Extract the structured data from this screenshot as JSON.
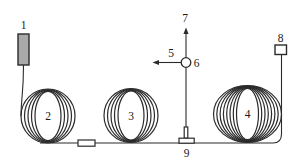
{
  "diagram": {
    "labels": {
      "n1": "1",
      "n2": "2",
      "n3": "3",
      "n4": "4",
      "n5": "5",
      "n6": "6",
      "n7": "7",
      "n8": "8",
      "n9": "9"
    },
    "colors": {
      "line": "#2b2b2b",
      "source_fill": "#a9a9a9",
      "component_fill": "#ffffff",
      "label": "#1a1a1a",
      "background": "#ffffff"
    }
  }
}
